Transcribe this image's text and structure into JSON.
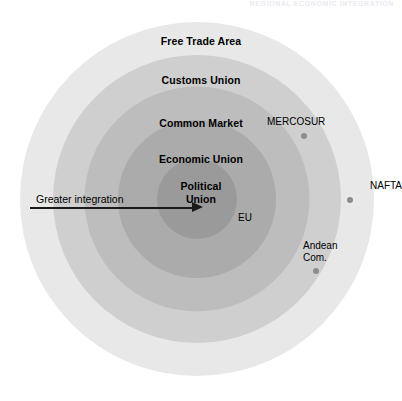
{
  "figure": {
    "running_header": "REGIONAL ECONOMIC INTEGRATION",
    "arrow": {
      "label": "Greater integration",
      "icon": "right-arrow-icon"
    },
    "rings": [
      {
        "label": "Free Trade Area",
        "color": "#e8e8e8"
      },
      {
        "label": "Customs Union",
        "color": "#cfcfcf"
      },
      {
        "label": "Common Market",
        "color": "#bdbdbd"
      },
      {
        "label": "Economic Union",
        "color": "#ababab"
      },
      {
        "label": "Political Union",
        "color": "#9a9a9a"
      }
    ],
    "ring_labels": {
      "free_trade_area": "Free Trade Area",
      "customs_union": "Customs Union",
      "common_market": "Common Market",
      "economic_union": "Economic Union",
      "political_union_line1": "Political",
      "political_union_line2": "Union"
    },
    "blocs": [
      {
        "name": "MERCOSUR",
        "label": "MERCOSUR",
        "dot_color": "#8d8d8d"
      },
      {
        "name": "NAFTA",
        "label": "NAFTA",
        "dot_color": "#8d8d8d"
      },
      {
        "name": "Andean Com",
        "label_line1": "Andean",
        "label_line2": "Com.",
        "dot_color": "#8d8d8d"
      },
      {
        "name": "EU",
        "label": "EU"
      }
    ],
    "bloc_labels": {
      "mercosur": "MERCOSUR",
      "nafta": "NAFTA",
      "andean_line1": "Andean",
      "andean_line2": "Com.",
      "eu": "EU"
    }
  }
}
